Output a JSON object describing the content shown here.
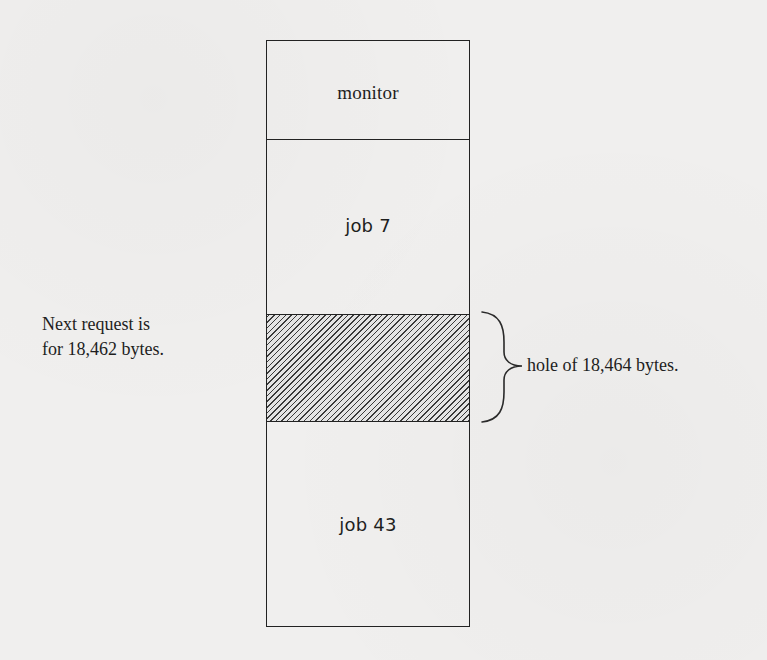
{
  "diagram": {
    "type": "memory-allocation",
    "segments": [
      {
        "id": "monitor",
        "label": "monitor",
        "hatched": false
      },
      {
        "id": "job7",
        "label": "job 7",
        "hatched": false
      },
      {
        "id": "hole",
        "label": "",
        "hatched": true
      },
      {
        "id": "job43",
        "label": "job 43",
        "hatched": false
      }
    ],
    "request_note": {
      "line1": "Next request is",
      "line2": "for 18,462 bytes."
    },
    "hole_annotation": {
      "label": "hole of 18,464 bytes.",
      "connector": "right-curly-brace"
    },
    "colors": {
      "background": "#f0efee",
      "ink": "#1e1e1e",
      "hatch": "#3a3a3a"
    }
  }
}
